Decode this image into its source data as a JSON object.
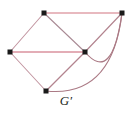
{
  "figure": {
    "caption": "G′",
    "caption_name": "graph-label",
    "background_color": "#ffffff",
    "width": 132,
    "height": 114
  },
  "diagram": {
    "type": "graph-drawing",
    "vertex_color": "#1a1a1a",
    "vertex_size": 4,
    "edge_color_straight": "#e8b9bf",
    "edge_color_thin": "#b98f9a",
    "edge_color_curve": "#a9747f",
    "vertices": [
      {
        "id": "v_top_left",
        "label": "",
        "x": 44,
        "y": 13
      },
      {
        "id": "v_top_right",
        "label": "",
        "x": 122,
        "y": 13
      },
      {
        "id": "v_left",
        "label": "",
        "x": 10,
        "y": 52
      },
      {
        "id": "v_center",
        "label": "",
        "x": 85,
        "y": 52
      },
      {
        "id": "v_bottom",
        "label": "",
        "x": 46,
        "y": 91
      }
    ],
    "edges": [
      {
        "id": "e_top",
        "from": "v_top_left",
        "to": "v_top_right",
        "shape": "straight",
        "weight": "thick"
      },
      {
        "id": "e_middle",
        "from": "v_left",
        "to": "v_center",
        "shape": "straight",
        "weight": "thick"
      },
      {
        "id": "e_topleft_left",
        "from": "v_top_left",
        "to": "v_left",
        "shape": "straight",
        "weight": "thin"
      },
      {
        "id": "e_topleft_center",
        "from": "v_top_left",
        "to": "v_center",
        "shape": "straight",
        "weight": "thin"
      },
      {
        "id": "e_left_bottom",
        "from": "v_left",
        "to": "v_bottom",
        "shape": "straight",
        "weight": "thin"
      },
      {
        "id": "e_center_bottom",
        "from": "v_center",
        "to": "v_bottom",
        "shape": "straight",
        "weight": "thin"
      },
      {
        "id": "e_center_topright",
        "from": "v_center",
        "to": "v_top_right",
        "shape": "straight",
        "weight": "thin"
      },
      {
        "id": "e_arc_inner",
        "from": "v_center",
        "to": "v_top_right",
        "shape": "curve",
        "weight": "thin",
        "bulge": "down-right"
      },
      {
        "id": "e_arc_outer",
        "from": "v_bottom",
        "to": "v_top_right",
        "shape": "curve",
        "weight": "thin",
        "bulge": "down-right"
      }
    ]
  }
}
